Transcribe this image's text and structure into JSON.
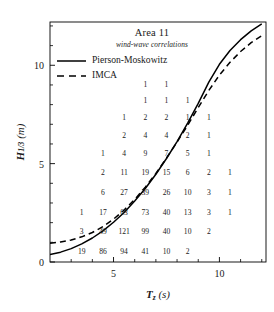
{
  "chart_data": {
    "type": "scatter",
    "title": "Area 11",
    "subtitle": "wind-wave correlations",
    "xlabel": "T_z (s)",
    "ylabel": "H_1/3 (m)",
    "xlim": [
      2.0,
      12.2
    ],
    "ylim": [
      0,
      12.2
    ],
    "xticks_major": [
      5,
      10
    ],
    "xticks_minor": [
      3,
      4,
      6,
      7,
      8,
      9,
      11,
      12
    ],
    "yticks_major": [
      0,
      5,
      10
    ],
    "yticks_minor": [
      1,
      2,
      3,
      4,
      6,
      7,
      8,
      9,
      11,
      12
    ],
    "grid": false,
    "legend_position": "upper-left",
    "annotation_kind": "scatter-count-matrix",
    "counts": [
      {
        "tz": 6.5,
        "h": 9.0,
        "n": "1"
      },
      {
        "tz": 7.5,
        "h": 9.0,
        "n": "1"
      },
      {
        "tz": 6.5,
        "h": 8.2,
        "n": "1"
      },
      {
        "tz": 7.5,
        "h": 8.2,
        "n": "1"
      },
      {
        "tz": 8.5,
        "h": 8.2,
        "n": "1"
      },
      {
        "tz": 5.5,
        "h": 7.3,
        "n": "1"
      },
      {
        "tz": 6.5,
        "h": 7.3,
        "n": "2"
      },
      {
        "tz": 7.5,
        "h": 7.3,
        "n": "2"
      },
      {
        "tz": 8.5,
        "h": 7.3,
        "n": "1"
      },
      {
        "tz": 9.5,
        "h": 7.3,
        "n": "1"
      },
      {
        "tz": 5.5,
        "h": 6.4,
        "n": "2"
      },
      {
        "tz": 6.5,
        "h": 6.4,
        "n": "4"
      },
      {
        "tz": 7.5,
        "h": 6.4,
        "n": "4"
      },
      {
        "tz": 8.5,
        "h": 6.4,
        "n": "2"
      },
      {
        "tz": 9.5,
        "h": 6.4,
        "n": "1"
      },
      {
        "tz": 4.5,
        "h": 5.5,
        "n": "1"
      },
      {
        "tz": 5.5,
        "h": 5.5,
        "n": "4"
      },
      {
        "tz": 6.5,
        "h": 5.5,
        "n": "9"
      },
      {
        "tz": 7.5,
        "h": 5.5,
        "n": "7"
      },
      {
        "tz": 8.5,
        "h": 5.5,
        "n": "5"
      },
      {
        "tz": 9.5,
        "h": 5.5,
        "n": "1"
      },
      {
        "tz": 4.5,
        "h": 4.5,
        "n": "2"
      },
      {
        "tz": 5.5,
        "h": 4.5,
        "n": "11"
      },
      {
        "tz": 6.5,
        "h": 4.5,
        "n": "19"
      },
      {
        "tz": 7.5,
        "h": 4.5,
        "n": "15"
      },
      {
        "tz": 8.5,
        "h": 4.5,
        "n": "6"
      },
      {
        "tz": 9.5,
        "h": 4.5,
        "n": "2"
      },
      {
        "tz": 10.5,
        "h": 4.5,
        "n": "1"
      },
      {
        "tz": 4.5,
        "h": 3.5,
        "n": "6"
      },
      {
        "tz": 5.5,
        "h": 3.5,
        "n": "27"
      },
      {
        "tz": 6.5,
        "h": 3.5,
        "n": "39"
      },
      {
        "tz": 7.5,
        "h": 3.5,
        "n": "26"
      },
      {
        "tz": 8.5,
        "h": 3.5,
        "n": "10"
      },
      {
        "tz": 9.5,
        "h": 3.5,
        "n": "3"
      },
      {
        "tz": 10.5,
        "h": 3.5,
        "n": "1"
      },
      {
        "tz": 3.5,
        "h": 2.5,
        "n": "1"
      },
      {
        "tz": 4.5,
        "h": 2.5,
        "n": "17"
      },
      {
        "tz": 5.5,
        "h": 2.5,
        "n": "63"
      },
      {
        "tz": 6.5,
        "h": 2.5,
        "n": "73"
      },
      {
        "tz": 7.5,
        "h": 2.5,
        "n": "40"
      },
      {
        "tz": 8.5,
        "h": 2.5,
        "n": "13"
      },
      {
        "tz": 9.5,
        "h": 2.5,
        "n": "3"
      },
      {
        "tz": 10.5,
        "h": 2.5,
        "n": "1"
      },
      {
        "tz": 3.5,
        "h": 1.5,
        "n": "3"
      },
      {
        "tz": 4.5,
        "h": 1.5,
        "n": "49"
      },
      {
        "tz": 5.5,
        "h": 1.5,
        "n": "121"
      },
      {
        "tz": 6.5,
        "h": 1.5,
        "n": "99"
      },
      {
        "tz": 7.5,
        "h": 1.5,
        "n": "40"
      },
      {
        "tz": 8.5,
        "h": 1.5,
        "n": "10"
      },
      {
        "tz": 9.5,
        "h": 1.5,
        "n": "2"
      },
      {
        "tz": 3.5,
        "h": 0.5,
        "n": "19"
      },
      {
        "tz": 4.5,
        "h": 0.5,
        "n": "86"
      },
      {
        "tz": 5.5,
        "h": 0.5,
        "n": "94"
      },
      {
        "tz": 6.5,
        "h": 0.5,
        "n": "41"
      },
      {
        "tz": 7.5,
        "h": 0.5,
        "n": "10"
      },
      {
        "tz": 8.5,
        "h": 0.5,
        "n": "2"
      }
    ],
    "series": [
      {
        "name": "Pierson-Moskowitz",
        "style": "solid",
        "color": "#000000",
        "points": [
          [
            2.0,
            0.38
          ],
          [
            2.5,
            0.5
          ],
          [
            3.0,
            0.68
          ],
          [
            3.5,
            0.92
          ],
          [
            4.0,
            1.22
          ],
          [
            4.5,
            1.58
          ],
          [
            5.0,
            2.02
          ],
          [
            5.5,
            2.52
          ],
          [
            6.0,
            3.1
          ],
          [
            6.5,
            3.74
          ],
          [
            7.0,
            4.46
          ],
          [
            7.5,
            5.26
          ],
          [
            8.0,
            6.12
          ],
          [
            8.5,
            7.06
          ],
          [
            9.0,
            8.06
          ],
          [
            9.5,
            9.14
          ],
          [
            10.0,
            10.05
          ],
          [
            10.5,
            10.75
          ],
          [
            11.0,
            11.3
          ],
          [
            11.5,
            11.75
          ],
          [
            12.0,
            12.1
          ]
        ]
      },
      {
        "name": "IMCA",
        "style": "dashed",
        "color": "#000000",
        "points": [
          [
            2.0,
            0.95
          ],
          [
            2.5,
            1.02
          ],
          [
            3.0,
            1.12
          ],
          [
            3.5,
            1.28
          ],
          [
            4.0,
            1.5
          ],
          [
            4.5,
            1.8
          ],
          [
            5.0,
            2.18
          ],
          [
            5.5,
            2.64
          ],
          [
            6.0,
            3.18
          ],
          [
            6.5,
            3.8
          ],
          [
            7.0,
            4.5
          ],
          [
            7.5,
            5.28
          ],
          [
            8.0,
            6.1
          ],
          [
            8.5,
            6.95
          ],
          [
            9.0,
            7.85
          ],
          [
            9.5,
            8.72
          ],
          [
            10.0,
            9.5
          ],
          [
            10.5,
            10.15
          ],
          [
            11.0,
            10.7
          ],
          [
            11.5,
            11.15
          ],
          [
            12.0,
            11.5
          ]
        ]
      }
    ],
    "legend": [
      {
        "label": "Pierson-Moskowitz",
        "style": "solid"
      },
      {
        "label": "IMCA",
        "style": "dashed"
      }
    ],
    "xtick_labels": [
      "5",
      "10"
    ],
    "ytick_labels": [
      "0",
      "5",
      "10"
    ]
  }
}
